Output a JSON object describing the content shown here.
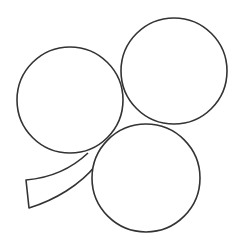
{
  "figure": {
    "stroke_color": "#333333",
    "fill_color": "#ffffff",
    "stroke_width": 1.6,
    "leaves": [
      {
        "name": "left-leaf",
        "cx": 70,
        "cy": 100,
        "r": 53
      },
      {
        "name": "top-right-leaf",
        "cx": 174,
        "cy": 71,
        "r": 53
      },
      {
        "name": "bottom-leaf",
        "cx": 146,
        "cy": 178,
        "r": 54
      }
    ],
    "stem": {
      "path": "M 88 153 C 70 170, 50 178, 26 180 L 29 208 C 55 200, 80 185, 96 165"
    }
  }
}
